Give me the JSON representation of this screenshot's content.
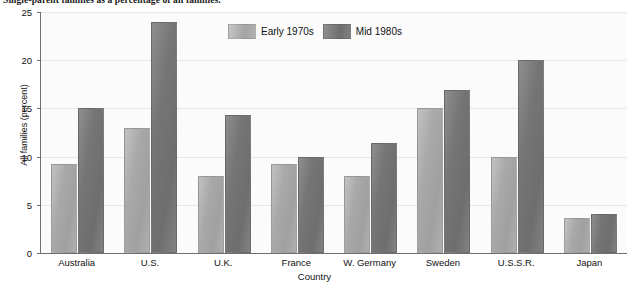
{
  "chart_data": {
    "type": "bar",
    "title": "Single-parent families as a percentage of all families.",
    "xlabel": "Country",
    "ylabel": "All families (percent)",
    "categories": [
      "Australia",
      "U.S.",
      "U.K.",
      "France",
      "W. Germany",
      "Sweden",
      "U.S.S.R.",
      "Japan"
    ],
    "series": [
      {
        "name": "Early 1970s",
        "color": "#a9a9a9",
        "values": [
          9.2,
          13.0,
          8.0,
          9.2,
          8.0,
          15.0,
          10.0,
          3.6
        ]
      },
      {
        "name": "Mid 1980s",
        "color": "#757575",
        "values": [
          15.0,
          24.0,
          14.3,
          10.0,
          11.4,
          16.9,
          20.0,
          4.0
        ]
      }
    ],
    "ylim": [
      0,
      25
    ],
    "yticks": [
      0,
      5,
      10,
      15,
      20,
      25
    ],
    "ytick_labels": [
      "0",
      "5",
      "10",
      "15",
      "20",
      "25"
    ],
    "grid": true,
    "legend_position": "top-center",
    "plot_background": "#fbfbfb",
    "axis_color": "#6f6f6f",
    "grid_color": "#e6e6e6"
  }
}
